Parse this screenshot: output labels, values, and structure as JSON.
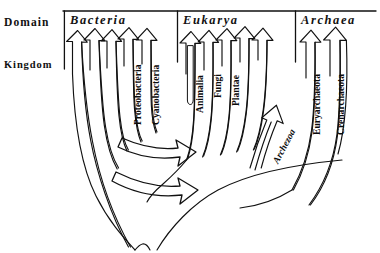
{
  "axis_labels": {
    "domain": "Domain",
    "kingdom": "Kingdom"
  },
  "domains": [
    {
      "name": "Bacteria",
      "id": "bacteria"
    },
    {
      "name": "Eukarya",
      "id": "eukarya"
    },
    {
      "name": "Archaea",
      "id": "archaea"
    }
  ],
  "kingdoms": {
    "bacteria": [
      "",
      "",
      "",
      "Proteobacteria",
      "Cyanobacteria"
    ],
    "eukarya": [
      "Animalia",
      "Fungi",
      "Plantae",
      "",
      "",
      "Archezoa"
    ],
    "archaea": [
      "Euryarchaeota",
      "Crenarchaeota"
    ]
  },
  "labels": {
    "proteobacteria": "Proteobacteria",
    "cyanobacteria": "Cyanobacteria",
    "animalia": "Animalia",
    "fungi": "Fungi",
    "plantae": "Plantae",
    "archezoa": "Archezoa",
    "euryarchaeota": "Euryarchaeota",
    "crenarchaeota": "Crenarchaeota"
  },
  "colors": {
    "ink": "#111111",
    "background": "#ffffff"
  },
  "diagram": {
    "type": "phylogenetic-tree",
    "root_position": [
      146,
      250
    ],
    "gene_transfer_arrows": 2
  }
}
